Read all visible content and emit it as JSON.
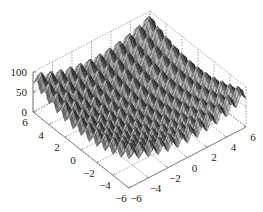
{
  "chart_data": {
    "type": "surface3d",
    "title": "",
    "xlabel": "",
    "ylabel": "",
    "zlabel": "",
    "function_hint": "Rastrigin-like: z = 20 + x^2 + y^2 - 10(cos 2πx + cos 2πy)",
    "x_range": [
      -6,
      6
    ],
    "y_range": [
      -6,
      6
    ],
    "zlim": [
      0,
      100
    ],
    "x_ticks": [
      "-6",
      "-4",
      "-2",
      "0",
      "2",
      "4",
      "6"
    ],
    "y_ticks": [
      "6",
      "4",
      "2",
      "0",
      "-2",
      "-4",
      "-6"
    ],
    "z_ticks": [
      "0",
      "50",
      "100"
    ],
    "grid": true,
    "colormap": "gray",
    "view": "default 3D (az -37.5, el 30)"
  },
  "colors": {
    "surface_dark": "#3a3a3a",
    "surface_light": "#a8a8a8",
    "grid": "#777777",
    "axis": "#888888"
  }
}
